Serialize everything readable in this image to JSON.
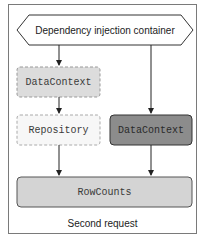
{
  "diagram": {
    "container": {
      "label": "Dependency injection container"
    },
    "nodes": {
      "datacontext_scoped": {
        "label": "DataContext",
        "style": "dashed-light",
        "fill": "#dcdcdc"
      },
      "repository": {
        "label": "Repository",
        "style": "dashed-white",
        "fill": "#f7f7f7"
      },
      "datacontext_dark": {
        "label": "DataContext",
        "style": "solid-dark",
        "fill": "#8c8c8c"
      },
      "rowcounts": {
        "label": "RowCounts",
        "style": "solid-gray",
        "fill": "#d4d4d4"
      }
    },
    "caption": "Second request"
  }
}
